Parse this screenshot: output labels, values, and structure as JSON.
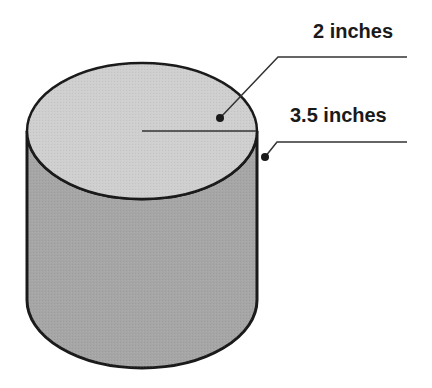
{
  "diagram": {
    "shape": "cylinder",
    "labels": {
      "diameter": "2 inches",
      "height": "3.5 inches"
    },
    "colors": {
      "top_face": "#cfcfcf",
      "side_face": "#a6a6a6",
      "outline": "#1a1a1a",
      "leader_line": "#333333"
    }
  }
}
